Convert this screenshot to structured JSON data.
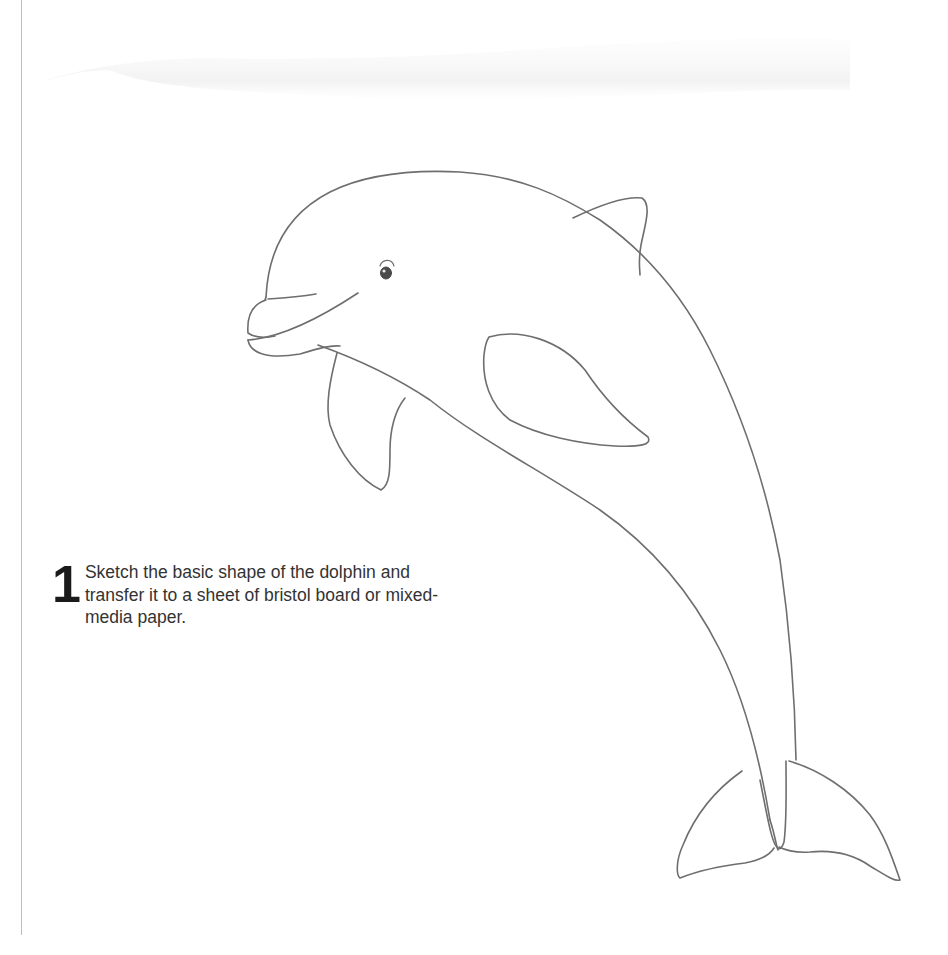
{
  "page": {
    "background": "#ffffff",
    "line_color": "#6e6e6e"
  },
  "illustration": {
    "subject": "dolphin",
    "style": "pencil outline sketch"
  },
  "step": {
    "number": "1",
    "text": "Sketch the basic shape of the dolphin and transfer it to a sheet of bristol board or mixed-media paper."
  }
}
